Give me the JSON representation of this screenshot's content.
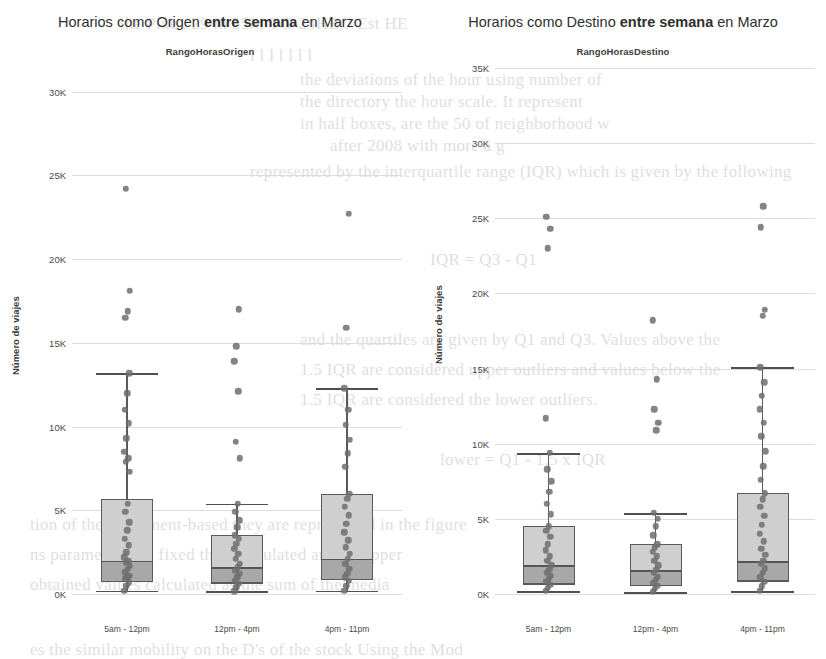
{
  "figure": {
    "background_color": "#ffffff",
    "box_fill_upper": "#cfcfcf",
    "box_fill_lower": "#a8a8a8",
    "point_color": "#6f6f6f",
    "line_color": "#5a5a5a"
  },
  "panels": [
    {
      "id": "origen",
      "title_prefix": "Horarios como Origen ",
      "title_bold": "entre semana",
      "title_suffix": " en Marzo",
      "legend_title": "RangoHorasOrigen",
      "axis_title": "Número de viajes"
    },
    {
      "id": "destino",
      "title_prefix": "Horarios como Destino ",
      "title_bold": "entre semana",
      "title_suffix": " en Marzo",
      "legend_title": "RangoHorasDestino",
      "axis_title": "Número de viajes"
    }
  ],
  "chart_data": [
    {
      "type": "box",
      "id": "origen",
      "title": "Horarios como Origen entre semana en Marzo",
      "legend_title": "RangoHorasOrigen",
      "xlabel": "",
      "ylabel": "Número de viajes",
      "ylim": [
        0,
        31000
      ],
      "yticks": [
        0,
        5000,
        10000,
        15000,
        20000,
        25000,
        30000
      ],
      "ytick_labels": [
        "0K",
        "5K",
        "10K",
        "15K",
        "20K",
        "25K",
        "30K"
      ],
      "grid": true,
      "legend_position": "top-center",
      "categories": [
        "5am - 12pm",
        "12pm - 4pm",
        "4pm - 11pm"
      ],
      "boxes": [
        {
          "category": "5am - 12pm",
          "whisker_low": 200,
          "q1": 800,
          "median": 2000,
          "q3": 5700,
          "whisker_high": 13200,
          "outliers": [
            24200,
            18100,
            16900,
            16500
          ],
          "points": [
            200,
            500,
            700,
            900,
            1000,
            1100,
            1300,
            1500,
            1700,
            1900,
            2000,
            2200,
            2500,
            2900,
            3300,
            3800,
            4300,
            4900,
            5400,
            7300,
            7900,
            8100,
            8500,
            9300,
            10200,
            11000,
            12000,
            13200,
            16500,
            16900,
            18100,
            24200
          ]
        },
        {
          "category": "12pm - 4pm",
          "whisker_low": 150,
          "q1": 700,
          "median": 1600,
          "q3": 3500,
          "whisker_high": 5400,
          "outliers": [
            17000,
            14800,
            13900,
            12100,
            9100,
            8100
          ],
          "points": [
            150,
            400,
            600,
            800,
            1000,
            1200,
            1400,
            1600,
            1800,
            2100,
            2400,
            2700,
            3000,
            3300,
            3500,
            4000,
            4400,
            4900,
            5400,
            8100,
            9100,
            12100,
            13900,
            14800,
            17000
          ]
        },
        {
          "category": "4pm - 11pm",
          "whisker_low": 200,
          "q1": 900,
          "median": 2100,
          "q3": 6000,
          "whisker_high": 12300,
          "outliers": [
            22700,
            15900
          ],
          "points": [
            200,
            500,
            800,
            1000,
            1200,
            1500,
            1800,
            2100,
            2400,
            2800,
            3200,
            3700,
            4200,
            4700,
            5200,
            5700,
            6000,
            7600,
            8400,
            9200,
            10100,
            11000,
            12300,
            15900,
            22700
          ]
        }
      ]
    },
    {
      "type": "box",
      "id": "destino",
      "title": "Horarios como Destino entre semana en Marzo",
      "legend_title": "RangoHorasDestino",
      "xlabel": "",
      "ylabel": "Número de viajes",
      "ylim": [
        0,
        36000
      ],
      "yticks": [
        0,
        5000,
        10000,
        15000,
        20000,
        25000,
        30000,
        35000
      ],
      "ytick_labels": [
        "0K",
        "5K",
        "10K",
        "15K",
        "20K",
        "25K",
        "30K",
        "35K"
      ],
      "grid": true,
      "legend_position": "top-center",
      "categories": [
        "5am - 12pm",
        "12pm - 4pm",
        "4pm - 11pm"
      ],
      "boxes": [
        {
          "category": "5am - 12pm",
          "whisker_low": 200,
          "q1": 700,
          "median": 1900,
          "q3": 4500,
          "whisker_high": 9400,
          "outliers": [
            25100,
            24300,
            23000,
            11700
          ],
          "points": [
            200,
            400,
            600,
            800,
            1000,
            1200,
            1400,
            1600,
            1900,
            2200,
            2500,
            2900,
            3300,
            3800,
            4200,
            4500,
            5300,
            6000,
            6800,
            7500,
            8300,
            9400,
            11700,
            23000,
            24300,
            25100
          ]
        },
        {
          "category": "12pm - 4pm",
          "whisker_low": 150,
          "q1": 600,
          "median": 1600,
          "q3": 3300,
          "whisker_high": 5400,
          "outliers": [
            18200,
            14300,
            12300,
            11400,
            10900
          ],
          "points": [
            150,
            350,
            550,
            750,
            950,
            1150,
            1400,
            1600,
            1900,
            2200,
            2500,
            2800,
            3100,
            3300,
            3900,
            4500,
            5000,
            5400,
            10900,
            11400,
            12300,
            14300,
            18200
          ]
        },
        {
          "category": "4pm - 11pm",
          "whisker_low": 200,
          "q1": 900,
          "median": 2200,
          "q3": 6700,
          "whisker_high": 15100,
          "outliers": [
            25800,
            24400,
            18900,
            18500
          ],
          "points": [
            200,
            500,
            800,
            1100,
            1400,
            1700,
            2000,
            2200,
            2600,
            3000,
            3500,
            4000,
            4600,
            5200,
            5800,
            6300,
            6700,
            7600,
            8500,
            9500,
            10500,
            11400,
            12300,
            13200,
            14100,
            15100,
            18500,
            18900,
            24400,
            25800
          ]
        }
      ]
    }
  ],
  "ghost_text": [
    {
      "x": 120,
      "y": 14,
      "text": "the Pine . 29 in 55M TG-24HBO Est HE"
    },
    {
      "x": 250,
      "y": 46,
      "text": "l l l l l l l"
    },
    {
      "x": 300,
      "y": 70,
      "text": "the deviations of the hour using number of"
    },
    {
      "x": 300,
      "y": 92,
      "text": "the directory the hour scale. It represent"
    },
    {
      "x": 300,
      "y": 114,
      "text": "in half boxes, are the 50 of neighborhood w"
    },
    {
      "x": 330,
      "y": 136,
      "text": "after 2008 with more a g"
    },
    {
      "x": 250,
      "y": 162,
      "text": "represented by the interquartile range (IQR) which is given by the following"
    },
    {
      "x": 430,
      "y": 250,
      "text": "IQR = Q3 - Q1"
    },
    {
      "x": 300,
      "y": 330,
      "text": "and the quartiles are given by Q1 and Q3. Values above the"
    },
    {
      "x": 300,
      "y": 360,
      "text": "1.5 IQR are considered upper outliers and values below the"
    },
    {
      "x": 300,
      "y": 390,
      "text": "1.5 IQR are considered the lower outliers."
    },
    {
      "x": 440,
      "y": 450,
      "text": "lower = Q1 - 1.5 x IQR"
    },
    {
      "x": 30,
      "y": 515,
      "text": "tion of the movement-based they are represented in the figure"
    },
    {
      "x": 30,
      "y": 545,
      "text": "ns parameters are fixed then calculated and an upper"
    },
    {
      "x": 30,
      "y": 575,
      "text": "obtained values calculated as the sum of the media"
    },
    {
      "x": 30,
      "y": 640,
      "text": "es the similar mobility on the D's of the stock Using the Mod"
    }
  ]
}
